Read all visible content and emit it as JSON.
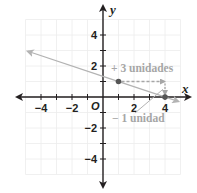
{
  "chart_data": {
    "type": "line",
    "title": "",
    "xlabel": "x",
    "ylabel": "y",
    "origin_label": "O",
    "xlim": [
      -5,
      5
    ],
    "ylim": [
      -5,
      5
    ],
    "grid": true,
    "x_tick_labels": [
      "−4",
      "−2",
      "2",
      "4"
    ],
    "x_tick_values": [
      -4,
      -2,
      2,
      4
    ],
    "y_tick_labels": [
      "4",
      "2",
      "−2",
      "−4"
    ],
    "y_tick_values": [
      4,
      2,
      -2,
      -4
    ],
    "series": [
      {
        "name": "line",
        "equation": "y = -1/3 x + 4/3",
        "slope": -0.3333,
        "intercept": 1.3333,
        "x": [
          -4.85,
          4.85
        ],
        "y": [
          2.95,
          -0.28
        ],
        "color": "#b3b3b3"
      }
    ],
    "points": [
      {
        "x": 1,
        "y": 1,
        "color": "#555555"
      },
      {
        "x": 4,
        "y": 0,
        "color": "#555555"
      }
    ],
    "annotations": [
      {
        "text": "+ 3 unidades",
        "type": "dashed-arrow",
        "from": [
          1,
          1
        ],
        "to": [
          4,
          1
        ],
        "color": "#a6a6a6"
      },
      {
        "text": "− 1 unidad",
        "type": "arrow",
        "from": [
          4,
          1
        ],
        "to": [
          4,
          0
        ],
        "color": "#a6a6a6"
      }
    ]
  }
}
